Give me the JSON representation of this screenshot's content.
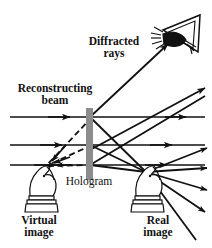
{
  "figure": {
    "width": 212,
    "height": 248,
    "background": "#ffffff",
    "ink_color": "#111111",
    "plate_color": "#8c8c8c"
  },
  "labels": {
    "diffracted_rays": "Diffracted\nrays",
    "reconstructing_beam": "Reconstructing\nbeam",
    "hologram": "Hologram",
    "virtual_image": "Virtual\nimage",
    "real_image": "Real\nimage"
  },
  "elements": {
    "hologram_plate": {
      "name": "Hologram plate",
      "x": 86,
      "y": 108,
      "width": 7,
      "height": 72,
      "color": "#8c8c8c"
    },
    "eye": {
      "name": "Observer eye",
      "x": 150,
      "y": 14,
      "width": 54,
      "height": 44
    },
    "virtual_knight": {
      "name": "Virtual image chess knight",
      "x": 24,
      "y": 163,
      "width": 40,
      "height": 50
    },
    "real_knight": {
      "name": "Real image chess knight",
      "x": 130,
      "y": 163,
      "width": 40,
      "height": 50
    }
  },
  "beams": {
    "reconstructing_beam_lines": [
      {
        "y": 117,
        "x_start": 10,
        "x_end": 205,
        "arrow_at": 68
      },
      {
        "y": 145,
        "x_start": 10,
        "x_end": 205,
        "arrow_at": 60
      },
      {
        "y": 165,
        "x_start": 10,
        "x_end": 205,
        "arrow_at": 52
      }
    ],
    "diffracted_rays_count": 6,
    "virtual_dashed_rays_count": 3,
    "styles": {
      "solid": "solid",
      "dashed": "dashed"
    }
  }
}
